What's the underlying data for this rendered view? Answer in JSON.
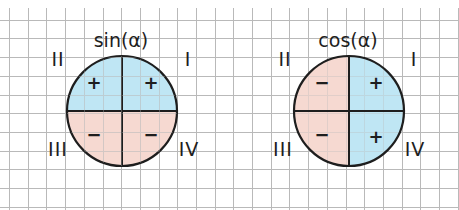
{
  "grid": {
    "spacing": 18.7,
    "origin_x": 9,
    "origin_y": 1,
    "color": "#b9b9b9"
  },
  "colors": {
    "positive": "#bfe6f4",
    "negative": "#f6d9d2",
    "ink": "#1e1e1e"
  },
  "diagrams": [
    {
      "title": "sin(α)",
      "center": [
        122,
        111
      ],
      "radius": 55,
      "quadrant_labels": {
        "I": "I",
        "II": "II",
        "III": "III",
        "IV": "IV"
      },
      "signs": {
        "I": "+",
        "II": "+",
        "III": "−",
        "IV": "−"
      }
    },
    {
      "title": "cos(α)",
      "center": [
        349,
        111
      ],
      "radius": 55,
      "quadrant_labels": {
        "I": "I",
        "II": "II",
        "III": "III",
        "IV": "IV"
      },
      "signs": {
        "I": "+",
        "II": "−",
        "III": "−",
        "IV": "+"
      }
    }
  ]
}
